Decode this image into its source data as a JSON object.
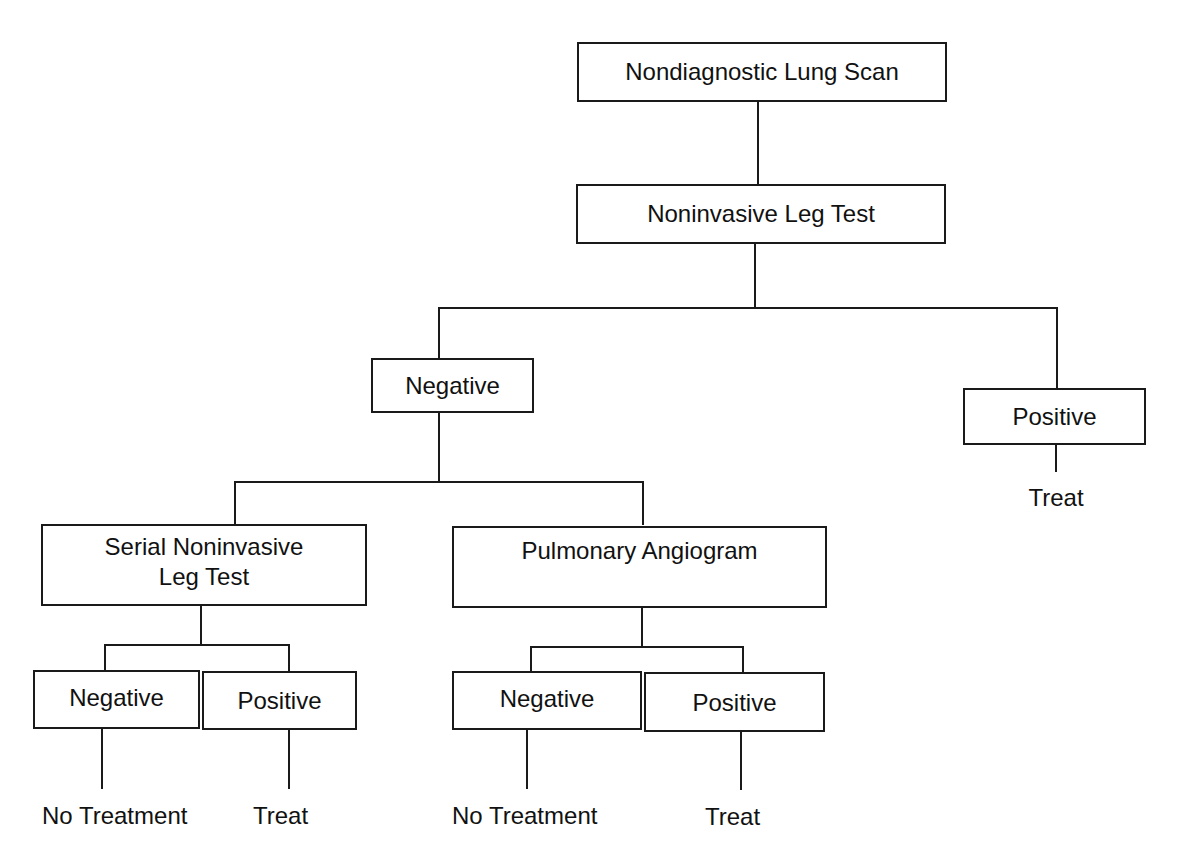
{
  "diagram": {
    "type": "decision-tree",
    "root": {
      "label": "Nondiagnostic Lung Scan"
    },
    "step2": {
      "label": "Noninvasive Leg Test"
    },
    "leg_negative": {
      "label": "Negative"
    },
    "leg_positive": {
      "label": "Positive",
      "outcome": "Treat"
    },
    "serial": {
      "label_line1": "Serial Noninvasive",
      "label_line2": "Leg Test",
      "negative": {
        "label": "Negative",
        "outcome": "No Treatment"
      },
      "positive": {
        "label": "Positive",
        "outcome": "Treat"
      }
    },
    "angiogram": {
      "label": "Pulmonary Angiogram",
      "negative": {
        "label": "Negative",
        "outcome": "No Treatment"
      },
      "positive": {
        "label": "Positive",
        "outcome": "Treat"
      }
    },
    "line_color": "#1a1a1a"
  }
}
